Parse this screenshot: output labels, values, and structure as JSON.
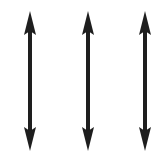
{
  "figure": {
    "arrow_color": "#1e1e1e",
    "background": "#ffffff",
    "arrows": [
      {
        "name": "arrow-left",
        "x": 30,
        "y_top": 11,
        "y_bottom": 151
      },
      {
        "name": "arrow-middle",
        "x": 88,
        "y_top": 11,
        "y_bottom": 151
      },
      {
        "name": "arrow-right",
        "x": 145,
        "y_top": 11,
        "y_bottom": 151
      }
    ]
  }
}
